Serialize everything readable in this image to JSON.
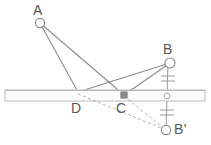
{
  "diagram": {
    "type": "geometry-diagram",
    "canvas": {
      "width": 211,
      "height": 145
    },
    "colors": {
      "line": "#8f8f8f",
      "line_dark": "#7a7a7a",
      "dashed": "#b0b0b0",
      "bar_fill": "#fbfbfb",
      "bar_stroke": "#b9b9b9",
      "marker_stroke": "#8a8a8a",
      "marker_fill": "#ffffff",
      "square_fill": "#8a8a8a",
      "label": "#585858",
      "background": "#ffffff"
    },
    "points": [
      {
        "id": "A",
        "label": "A",
        "x": 40,
        "y": 23,
        "marker": "open-circle",
        "radius": 4.6
      },
      {
        "id": "B",
        "label": "B",
        "x": 170,
        "y": 63,
        "marker": "open-circle",
        "radius": 5.0
      },
      {
        "id": "Bp",
        "label": "B'",
        "x": 166,
        "y": 130,
        "marker": "open-circle",
        "radius": 4.6
      },
      {
        "id": "D",
        "label": "D",
        "x": 78,
        "y": 92,
        "marker": "none",
        "radius": 0
      },
      {
        "id": "C",
        "label": "C",
        "x": 124,
        "y": 95,
        "marker": "filled-square",
        "radius": 3.2
      },
      {
        "id": "M",
        "label": "",
        "x": 167,
        "y": 96,
        "marker": "open-circle",
        "radius": 2.8
      }
    ],
    "solid_segments": [
      {
        "from": "A",
        "to": "D"
      },
      {
        "from": "A",
        "to": "C"
      },
      {
        "from": "B",
        "to": "D"
      },
      {
        "from": "B",
        "to": "C"
      },
      {
        "from": "B",
        "to": "Bp"
      }
    ],
    "dashed_segments": [
      {
        "from": "D",
        "to": "Bp"
      },
      {
        "from": "C",
        "to": "Bp"
      }
    ],
    "bar": {
      "name": "mirror-bar",
      "x": 5,
      "y": 90,
      "width": 200,
      "height": 11
    },
    "tick_marks": {
      "description": "double hash marks denoting equal segments B-M and M-B'",
      "segments": [
        {
          "on": "B-M",
          "count": 2,
          "center_y": 79
        },
        {
          "on": "M-Bp",
          "count": 2,
          "center_y": 113
        }
      ]
    }
  }
}
